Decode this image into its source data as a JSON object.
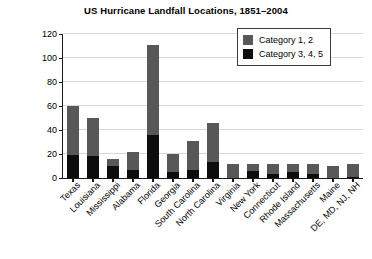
{
  "chart_data": {
    "type": "bar",
    "title": "US Hurricane Landfall Locations, 1851–2004",
    "xlabel": "",
    "ylabel": "Number of Hurricanes",
    "ylim": [
      0,
      120
    ],
    "ytick_values": [
      0,
      20,
      40,
      60,
      80,
      100,
      120
    ],
    "ytick_labels": [
      "0",
      "20",
      "40",
      "60",
      "80",
      "100",
      "120"
    ],
    "grid": true,
    "stacked": true,
    "legend_position": "top-right",
    "categories": [
      "Texas",
      "Louisiana",
      "Mississippi",
      "Alabama",
      "Florida",
      "Georgia",
      "South Carolina",
      "North Carolina",
      "Virginia",
      "New York",
      "Connecticut",
      "Rhode Island",
      "Massachusetts",
      "Maine",
      "DE, MD, NJ, NH"
    ],
    "series": [
      {
        "name": "Category 3, 4, 5",
        "color": "#0d0d0d",
        "values": [
          19,
          18,
          10,
          7,
          36,
          5,
          7,
          13,
          0,
          6,
          3,
          5,
          3,
          0,
          1
        ]
      },
      {
        "name": "Category 1, 2",
        "color": "#585858",
        "values": [
          41,
          32,
          6,
          15,
          75,
          15,
          24,
          33,
          12,
          6,
          9,
          7,
          9,
          10,
          11
        ]
      }
    ],
    "totals": [
      60,
      50,
      16,
      22,
      111,
      20,
      31,
      46,
      12,
      12,
      12,
      12,
      12,
      10,
      12
    ]
  },
  "legend": {
    "items": [
      {
        "label": "Category 1, 2",
        "color": "#585858"
      },
      {
        "label": "Category 3, 4, 5",
        "color": "#0d0d0d"
      }
    ]
  }
}
